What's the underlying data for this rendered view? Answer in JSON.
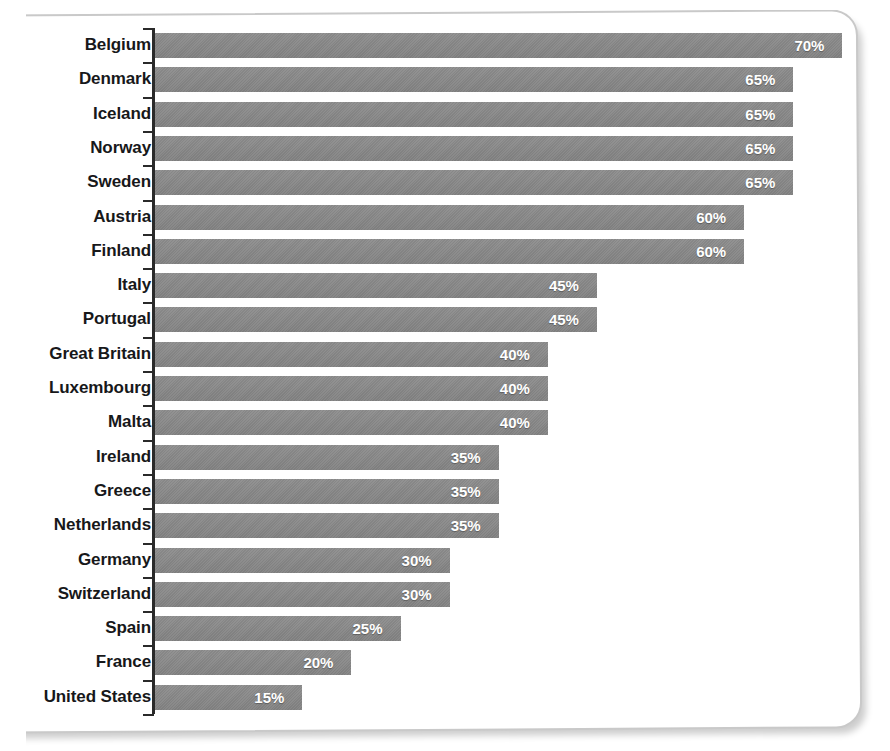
{
  "chart_data": {
    "type": "bar",
    "orientation": "horizontal",
    "title": "",
    "subtitle": "",
    "xlabel": "",
    "ylabel": "",
    "xlim": [
      0,
      75
    ],
    "grid": false,
    "legend": "none",
    "value_suffix": "%",
    "categories": [
      "Belgium",
      "Denmark",
      "Iceland",
      "Norway",
      "Sweden",
      "Austria",
      "Finland",
      "Italy",
      "Portugal",
      "Great Britain",
      "Luxembourg",
      "Malta",
      "Ireland",
      "Greece",
      "Netherlands",
      "Germany",
      "Switzerland",
      "Spain",
      "France",
      "United States"
    ],
    "values": [
      70,
      65,
      65,
      65,
      65,
      60,
      60,
      45,
      45,
      40,
      40,
      40,
      35,
      35,
      35,
      30,
      30,
      25,
      20,
      15
    ],
    "value_labels": [
      "70%",
      "65%",
      "65%",
      "65%",
      "65%",
      "60%",
      "60%",
      "45%",
      "45%",
      "40%",
      "40%",
      "40%",
      "35%",
      "35%",
      "35%",
      "30%",
      "30%",
      "25%",
      "20%",
      "15%"
    ],
    "bar_color": "#8a8a8a",
    "value_label_color": "#ffffff",
    "category_label_color": "#17181a",
    "axis_color": "#2a2a2a",
    "background_color": "#ffffff"
  },
  "frame": {
    "caption_partial": ""
  }
}
